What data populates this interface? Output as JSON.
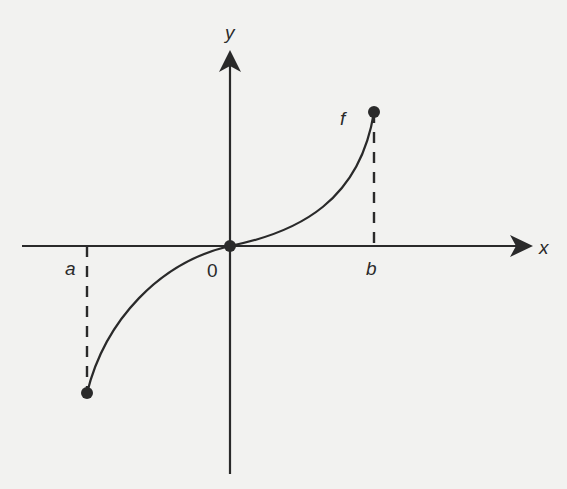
{
  "diagram": {
    "type": "function-graph",
    "colors": {
      "background": "#f2f2f0",
      "ink": "#2a2a2a"
    },
    "axes": {
      "x_label": "x",
      "y_label": "y",
      "origin_label": "0"
    },
    "points": {
      "a_label": "a",
      "b_label": "b",
      "function_label": "f"
    }
  }
}
